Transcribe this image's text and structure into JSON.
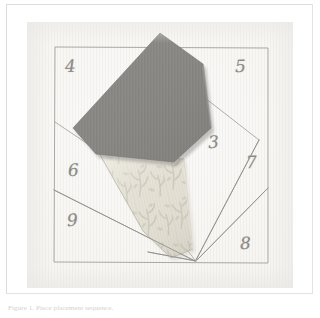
{
  "figure": {
    "caption": "Figure 1. Piece placement sequence.",
    "photo": {
      "alt_name": "foundation-paper-pieced-quilt-block-photo",
      "background_color": "#f6f5f2",
      "paper_color": "#faf9f6"
    }
  },
  "block": {
    "title": "Foundation paper piecing block",
    "drawn_frame": {
      "line_color": "#9a9894",
      "corners": [
        {
          "x": 55,
          "y": 47
        },
        {
          "x": 268,
          "y": 48
        },
        {
          "x": 268,
          "y": 263
        },
        {
          "x": 54,
          "y": 262
        }
      ]
    },
    "sections": [
      {
        "label": "3",
        "x": 209,
        "y": 136,
        "rotation": -4
      },
      {
        "label": "4",
        "x": 66,
        "y": 61,
        "rotation": -3
      },
      {
        "label": "5",
        "x": 236,
        "y": 61,
        "rotation": -2
      },
      {
        "label": "6",
        "x": 69,
        "y": 165,
        "rotation": -3
      },
      {
        "label": "7",
        "x": 247,
        "y": 157,
        "rotation": -2
      },
      {
        "label": "8",
        "x": 241,
        "y": 237,
        "rotation": -2
      },
      {
        "label": "9",
        "x": 68,
        "y": 214,
        "rotation": -3
      }
    ],
    "pencil_lines": [
      {
        "name": "seam-4-6",
        "x1": 55,
        "y1": 122,
        "x2": 120,
        "y2": 166
      },
      {
        "name": "seam-5-3",
        "x1": 204,
        "y1": 98,
        "x2": 258,
        "y2": 139
      },
      {
        "name": "seam-3-7",
        "x1": 258,
        "y1": 139,
        "x2": 195,
        "y2": 260
      },
      {
        "name": "seam-7-8",
        "x1": 268,
        "y1": 188,
        "x2": 197,
        "y2": 260
      },
      {
        "name": "seam-9-fan",
        "x1": 54,
        "y1": 190,
        "x2": 195,
        "y2": 261
      },
      {
        "name": "seam-1-2",
        "x1": 148,
        "y1": 252,
        "x2": 196,
        "y2": 261
      }
    ]
  },
  "fabric_pieces": [
    {
      "name": "dark-gray-fabric-piece",
      "color": "#8f8d8a",
      "shadow_color": "#7d7b78",
      "points": "160,34 203,65 211,129 174,163 96,155 73,129"
    },
    {
      "name": "cream-floral-fabric-piece",
      "color": "#e4e0d4",
      "motif_color": "#b9bcab",
      "points": "96,155 181,160 190,250 168,259 140,232"
    }
  ],
  "colors": {
    "paper": "#faf9f6",
    "pencil": "#9a9894",
    "numeral": "#8d8b88",
    "dark_fabric": "#8f8d8a",
    "floral_fabric": "#e4e0d4",
    "caption_text": "#d2d0cd",
    "scan_border": "#e3e3e3"
  }
}
